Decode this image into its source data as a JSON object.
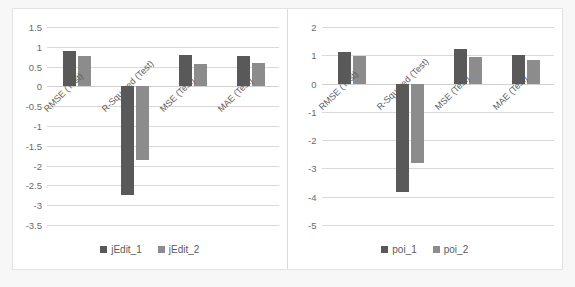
{
  "colors": {
    "series1": "#595959",
    "series2": "#8c8c8c",
    "gridline": "#d9d9d9",
    "axis_text": "#6a6a6a",
    "panel_bg": "#ffffff",
    "page_bg": "#f7f7f7"
  },
  "chart_data": [
    {
      "type": "bar",
      "title": "",
      "xlabel": "",
      "ylabel": "",
      "panel": "left",
      "categories": [
        "RMSE (Test)",
        "R-Squared (Test)",
        "MSE (Test)",
        "MAE (Test)"
      ],
      "series": [
        {
          "name": "jEdit_1",
          "color": "#595959",
          "values": [
            0.9,
            -2.75,
            0.8,
            0.78
          ]
        },
        {
          "name": "jEdit_2",
          "color": "#8c8c8c",
          "values": [
            0.78,
            -1.85,
            0.57,
            0.59
          ]
        }
      ],
      "ylim": [
        -3.5,
        1.5
      ],
      "yticks": [
        "1.5",
        "1",
        "0.5",
        "0",
        "-0.5",
        "-1",
        "-1.5",
        "-2",
        "-2.5",
        "-3",
        "-3.5"
      ],
      "ytick_values": [
        1.5,
        1,
        0.5,
        0,
        -0.5,
        -1,
        -1.5,
        -2,
        -2.5,
        -3,
        -3.5
      ],
      "grid": true,
      "legend_position": "bottom",
      "legend": [
        "jEdit_1",
        "jEdit_2"
      ]
    },
    {
      "type": "bar",
      "title": "",
      "xlabel": "",
      "ylabel": "",
      "panel": "right",
      "categories": [
        "RMSE (Test)",
        "R-Squared (Test)",
        "MSE (Test)",
        "MAE (Test)"
      ],
      "series": [
        {
          "name": "poi_1",
          "color": "#595959",
          "values": [
            1.1,
            -3.85,
            1.22,
            1.0
          ]
        },
        {
          "name": "poi_2",
          "color": "#8c8c8c",
          "values": [
            0.97,
            -2.8,
            0.94,
            0.82
          ]
        }
      ],
      "ylim": [
        -5,
        2
      ],
      "yticks": [
        "2",
        "1",
        "0",
        "-1",
        "-2",
        "-3",
        "-4",
        "-5"
      ],
      "ytick_values": [
        2,
        1,
        0,
        -1,
        -2,
        -3,
        -4,
        -5
      ],
      "grid": true,
      "legend_position": "bottom",
      "legend": [
        "poi_1",
        "poi_2"
      ]
    }
  ]
}
